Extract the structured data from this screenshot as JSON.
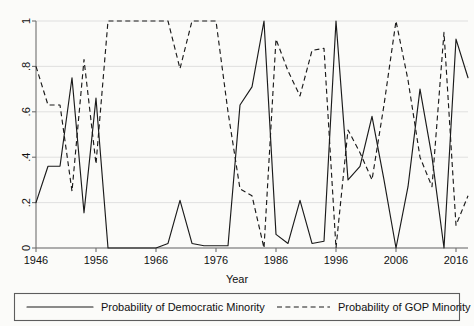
{
  "chart_data": {
    "type": "line",
    "title": "",
    "xlabel": "Year",
    "ylabel": "",
    "xlim": [
      1946,
      2018
    ],
    "ylim": [
      0,
      1
    ],
    "grid": true,
    "legend_position": "bottom",
    "xticks": [
      1946,
      1956,
      1966,
      1976,
      1986,
      1996,
      2006,
      2016
    ],
    "xticklabels": [
      "1946",
      "1956",
      "1966",
      "1976",
      "1986",
      "1996",
      "2006",
      "2016"
    ],
    "yticks": [
      0,
      0.2,
      0.4,
      0.6,
      0.8,
      1
    ],
    "yticklabels": [
      "0",
      ".2",
      ".4",
      ".6",
      ".8",
      "1"
    ],
    "series": [
      {
        "name": "Probability of Democratic Minority",
        "style": "solid",
        "color": "#1a1a1a",
        "x": [
          1946,
          1948,
          1950,
          1952,
          1954,
          1956,
          1958,
          1960,
          1962,
          1964,
          1966,
          1968,
          1970,
          1972,
          1974,
          1976,
          1978,
          1980,
          1982,
          1984,
          1986,
          1988,
          1990,
          1992,
          1994,
          1996,
          1998,
          2000,
          2002,
          2004,
          2006,
          2008,
          2010,
          2012,
          2014,
          2016,
          2018
        ],
        "values": [
          0.2,
          0.36,
          0.36,
          0.75,
          0.155,
          0.66,
          0.0,
          0.0,
          0.0,
          0.0,
          0.0,
          0.02,
          0.21,
          0.02,
          0.01,
          0.01,
          0.01,
          0.63,
          0.71,
          1.0,
          0.06,
          0.02,
          0.21,
          0.02,
          0.03,
          1.0,
          0.3,
          0.36,
          0.58,
          0.3,
          0.0,
          0.27,
          0.7,
          0.4,
          0.0,
          0.92,
          0.75
        ]
      },
      {
        "name": "Probability of GOP Minority",
        "style": "dashed",
        "color": "#1a1a1a",
        "x": [
          1946,
          1948,
          1950,
          1952,
          1954,
          1956,
          1958,
          1960,
          1962,
          1964,
          1966,
          1968,
          1970,
          1972,
          1974,
          1976,
          1978,
          1980,
          1982,
          1984,
          1986,
          1988,
          1990,
          1992,
          1994,
          1996,
          1998,
          2000,
          2002,
          2004,
          2006,
          2008,
          2010,
          2012,
          2014,
          2016,
          2018
        ],
        "values": [
          0.8,
          0.63,
          0.63,
          0.25,
          0.83,
          0.37,
          1.0,
          1.0,
          1.0,
          1.0,
          1.0,
          1.0,
          0.79,
          1.0,
          1.0,
          1.0,
          0.6,
          0.26,
          0.23,
          0.0,
          0.92,
          0.78,
          0.67,
          0.87,
          0.88,
          0.0,
          0.52,
          0.42,
          0.3,
          0.63,
          1.0,
          0.74,
          0.4,
          0.27,
          0.95,
          0.1,
          0.23
        ]
      }
    ]
  },
  "axis": {
    "x_axis_title": "Year",
    "y_axis_title": ""
  },
  "legend": {
    "entries": [
      {
        "label": "Probability of Democratic Minority",
        "style": "solid"
      },
      {
        "label": "Probability of GOP Minority",
        "style": "dashed"
      }
    ]
  }
}
